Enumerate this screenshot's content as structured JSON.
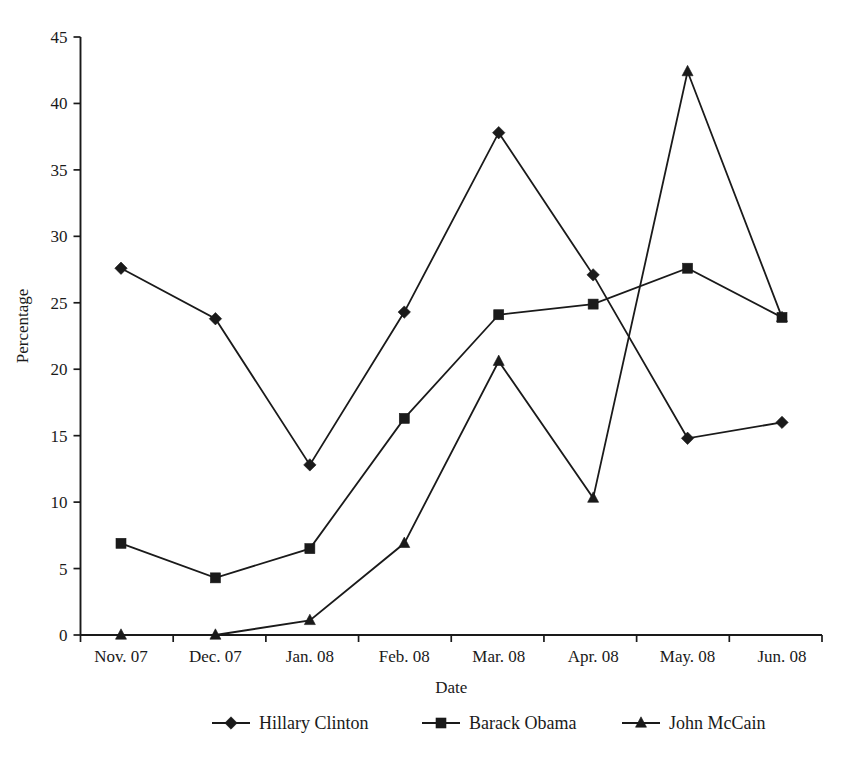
{
  "chart_data": {
    "type": "line",
    "title": "",
    "xlabel": "Date",
    "ylabel": "Percentage",
    "categories": [
      "Nov. 07",
      "Dec. 07",
      "Jan. 08",
      "Feb. 08",
      "Mar. 08",
      "Apr. 08",
      "May. 08",
      "Jun. 08"
    ],
    "ylim": [
      0,
      45
    ],
    "ytick_values": [
      0,
      5,
      10,
      15,
      20,
      25,
      30,
      35,
      40,
      45
    ],
    "ytick_labels": [
      "0",
      "5",
      "10",
      "15",
      "20",
      "25",
      "30",
      "35",
      "40",
      "45"
    ],
    "grid": false,
    "legend_position": "bottom",
    "series": [
      {
        "name": "Hillary Clinton",
        "marker": "diamond",
        "values": [
          27.6,
          23.8,
          12.8,
          24.3,
          37.8,
          27.1,
          14.8,
          16.0
        ]
      },
      {
        "name": "Barack Obama",
        "marker": "square",
        "values": [
          6.9,
          4.3,
          6.5,
          16.3,
          24.1,
          24.9,
          27.6,
          23.9
        ]
      },
      {
        "name": "John McCain",
        "marker": "triangle",
        "values": [
          0.0,
          0.0,
          1.1,
          6.9,
          20.6,
          10.3,
          42.4,
          23.9
        ]
      }
    ]
  },
  "colors": {
    "ink": "#1a1a1a",
    "background": "#ffffff"
  }
}
